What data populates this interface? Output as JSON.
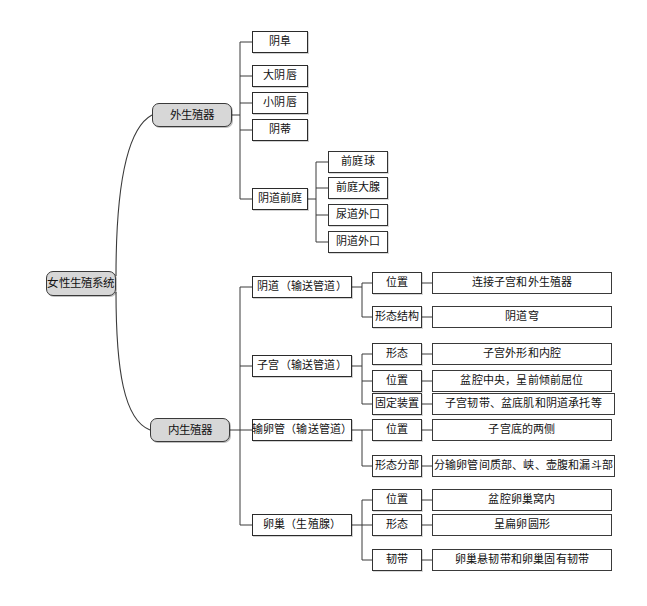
{
  "diagram": {
    "title": "女性生殖系统",
    "type": "mind-map",
    "colors": {
      "branch_fill": "#d7d7d7",
      "leaf_fill": "#ffffff",
      "stroke": "#2b2b2b",
      "background": "#ffffff"
    },
    "root": {
      "label": "女性生殖系统"
    },
    "branches": [
      {
        "label": "外生殖器",
        "children": [
          {
            "label": "阴阜",
            "children": []
          },
          {
            "label": "大阴唇",
            "children": []
          },
          {
            "label": "小阴唇",
            "children": []
          },
          {
            "label": "阴蒂",
            "children": []
          },
          {
            "label": "阴道前庭",
            "children": [
              {
                "label": "前庭球"
              },
              {
                "label": "前庭大腺"
              },
              {
                "label": "尿道外口"
              },
              {
                "label": "阴道外口"
              }
            ]
          }
        ]
      },
      {
        "label": "内生殖器",
        "children": [
          {
            "label": "阴道（输送管道）",
            "children": [
              {
                "label": "位置",
                "detail": "连接子宫和外生殖器"
              },
              {
                "label": "形态结构",
                "detail": "阴道穹"
              }
            ]
          },
          {
            "label": "子宫（输送管道）",
            "children": [
              {
                "label": "形态",
                "detail": "子宫外形和内腔"
              },
              {
                "label": "位置",
                "detail": "盆腔中央，呈前倾前屈位"
              },
              {
                "label": "固定装置",
                "detail": "子宫韧带、盆底肌和阴道承托等"
              }
            ]
          },
          {
            "label": "输卵管（输送管道）",
            "children": [
              {
                "label": "位置",
                "detail": "子宫底的两侧"
              },
              {
                "label": "形态分部",
                "detail": "分输卵管间质部、峡、壶腹和漏斗部"
              }
            ]
          },
          {
            "label": "卵巢（生殖腺）",
            "children": [
              {
                "label": "位置",
                "detail": "盆腔卵巢窝内"
              },
              {
                "label": "形态",
                "detail": "呈扁卵圆形"
              },
              {
                "label": "韧带",
                "detail": "卵巢悬韧带和卵巢固有韧带"
              }
            ]
          }
        ]
      }
    ]
  },
  "nodes": {
    "root": "女性生殖系统",
    "b1": "外生殖器",
    "b2": "内生殖器",
    "e1": "阴阜",
    "e2": "大阴唇",
    "e3": "小阴唇",
    "e4": "阴蒂",
    "e5": "阴道前庭",
    "v1": "前庭球",
    "v2": "前庭大腺",
    "v3": "尿道外口",
    "v4": "阴道外口",
    "i1": "阴道（输送管道）",
    "i1a": "位置",
    "i1a_d": "连接子宫和外生殖器",
    "i1b": "形态结构",
    "i1b_d": "阴道穹",
    "i2": "子宫（输送管道）",
    "i2a": "形态",
    "i2a_d": "子宫外形和内腔",
    "i2b": "位置",
    "i2b_d": "盆腔中央，呈前倾前屈位",
    "i2c": "固定装置",
    "i2c_d": "子宫韧带、盆底肌和阴道承托等",
    "i3": "输卵管（输送管道）",
    "i3a": "位置",
    "i3a_d": "子宫底的两侧",
    "i3b": "形态分部",
    "i3b_d": "分输卵管间质部、峡、壶腹和漏斗部",
    "i4": "卵巢（生殖腺）",
    "i4a": "位置",
    "i4a_d": "盆腔卵巢窝内",
    "i4b": "形态",
    "i4b_d": "呈扁卵圆形",
    "i4c": "韧带",
    "i4c_d": "卵巢悬韧带和卵巢固有韧带"
  }
}
